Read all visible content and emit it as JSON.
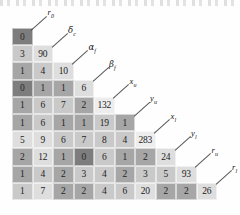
{
  "figure": {
    "type": "lower-triangular-heatmap",
    "variables": [
      "r0",
      "dc",
      "af",
      "bf",
      "xu",
      "yu",
      "xl",
      "yl",
      "ru",
      "rl"
    ],
    "labels": [
      {
        "text": "r",
        "sub": "0",
        "greek": false
      },
      {
        "text": "δ",
        "sub": "c",
        "greek": true
      },
      {
        "text": "α",
        "sub": "f",
        "greek": true
      },
      {
        "text": "β",
        "sub": "f",
        "greek": true
      },
      {
        "text": "x",
        "sub": "u",
        "greek": false
      },
      {
        "text": "y",
        "sub": "u",
        "greek": false
      },
      {
        "text": "x",
        "sub": "l",
        "greek": false
      },
      {
        "text": "y",
        "sub": "l",
        "greek": false
      },
      {
        "text": "r",
        "sub": "u",
        "greek": false
      },
      {
        "text": "r",
        "sub": "l",
        "greek": false
      }
    ],
    "rows": [
      {
        "values": [
          0
        ]
      },
      {
        "values": [
          3,
          90
        ]
      },
      {
        "values": [
          1,
          4,
          10
        ]
      },
      {
        "values": [
          0,
          1,
          1,
          6
        ]
      },
      {
        "values": [
          1,
          6,
          7,
          2,
          132
        ]
      },
      {
        "values": [
          1,
          6,
          1,
          1,
          19,
          1
        ]
      },
      {
        "values": [
          5,
          9,
          6,
          7,
          8,
          4,
          283
        ]
      },
      {
        "values": [
          2,
          12,
          1,
          0,
          6,
          1,
          2,
          24
        ]
      },
      {
        "values": [
          1,
          4,
          2,
          3,
          4,
          2,
          3,
          5,
          93
        ]
      },
      {
        "values": [
          1,
          7,
          2,
          2,
          4,
          6,
          20,
          2,
          2,
          26
        ]
      }
    ],
    "shades": [
      [
        "dark"
      ],
      [
        "light",
        "pale"
      ],
      [
        "mid",
        "light",
        "pale"
      ],
      [
        "dark",
        "mid",
        "mid",
        "pale"
      ],
      [
        "mid",
        "light",
        "light",
        "mid",
        "white"
      ],
      [
        "mid",
        "light",
        "mid",
        "mid",
        "light",
        "mid"
      ],
      [
        "pale",
        "pale",
        "light",
        "light",
        "light",
        "light",
        "white"
      ],
      [
        "mid",
        "pale",
        "mid",
        "dark",
        "light",
        "mid",
        "mid",
        "pale"
      ],
      [
        "mid",
        "light",
        "mid",
        "light",
        "light",
        "mid",
        "light",
        "light",
        "pale"
      ],
      [
        "light",
        "pale",
        "mid",
        "mid",
        "light",
        "light",
        "pale",
        "mid",
        "mid",
        "pale"
      ]
    ],
    "colors": {
      "dark": "#7d7d7d",
      "mid": "#a6a6a6",
      "light": "#c9c9c9",
      "pale": "#dedede",
      "white": "#ededed",
      "text": "#1b1b1b",
      "leader": "#3a3a3a",
      "background": "#ffffff"
    }
  }
}
